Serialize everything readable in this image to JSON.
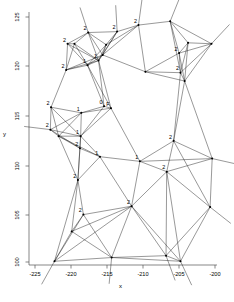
{
  "figure": {
    "background": "#ffffff",
    "line_color": "#000000",
    "text_color": "#000000",
    "width": 234,
    "height": 302
  },
  "axes": {
    "x_label": "x",
    "y_label": "y",
    "x_ticks": [
      "-225",
      "-220",
      "-215",
      "-210",
      "-205",
      "-200"
    ],
    "y_ticks": [
      "100",
      "105",
      "110",
      "115",
      "120",
      "125"
    ],
    "x_range": [
      -226.5,
      -199.2
    ],
    "y_range": [
      99.2,
      126.3
    ],
    "plot_left": 29,
    "plot_right": 217,
    "plot_top": 12,
    "plot_bottom": 265
  },
  "chart_data": {
    "type": "scatter",
    "title": "",
    "xlabel": "x",
    "ylabel": "y",
    "xlim": [
      -226.5,
      -199.2
    ],
    "ylim": [
      99.2,
      126.3
    ],
    "xticks": [
      -225,
      -220,
      -215,
      -210,
      -205,
      -200
    ],
    "yticks": [
      100,
      105,
      110,
      115,
      120,
      125
    ],
    "grid": false,
    "legend": "none",
    "nodes": [
      {
        "id": 0,
        "x": -220.9,
        "y": 122.9,
        "label": "2"
      },
      {
        "id": 1,
        "x": -219.9,
        "y": 122.9,
        "label": ""
      },
      {
        "id": 2,
        "x": -217.9,
        "y": 124.1,
        "label": "2"
      },
      {
        "id": 3,
        "x": -215.3,
        "y": 122.8,
        "label": ""
      },
      {
        "id": 4,
        "x": -213.7,
        "y": 124.2,
        "label": "2"
      },
      {
        "id": 5,
        "x": -210.6,
        "y": 124.9,
        "label": "2"
      },
      {
        "id": 6,
        "x": -206.0,
        "y": 125.3,
        "label": ""
      },
      {
        "id": 7,
        "x": -203.4,
        "y": 123.0,
        "label": ""
      },
      {
        "id": 8,
        "x": -221.1,
        "y": 120.1,
        "label": "2"
      },
      {
        "id": 9,
        "x": -218.0,
        "y": 120.6,
        "label": "1"
      },
      {
        "id": 10,
        "x": -216.4,
        "y": 121.1,
        "label": "1"
      },
      {
        "id": 11,
        "x": -215.8,
        "y": 121.7,
        "label": ""
      },
      {
        "id": 12,
        "x": -209.6,
        "y": 119.9,
        "label": ""
      },
      {
        "id": 13,
        "x": -204.7,
        "y": 121.9,
        "label": "2"
      },
      {
        "id": 14,
        "x": -204.5,
        "y": 119.8,
        "label": "2"
      },
      {
        "id": 15,
        "x": -203.9,
        "y": 118.9,
        "label": ""
      },
      {
        "id": 16,
        "x": -223.3,
        "y": 116.1,
        "label": "2"
      },
      {
        "id": 17,
        "x": -218.9,
        "y": 115.5,
        "label": "1"
      },
      {
        "id": 18,
        "x": -215.6,
        "y": 116.2,
        "label": "0"
      },
      {
        "id": 19,
        "x": -214.6,
        "y": 116.0,
        "label": "F"
      },
      {
        "id": 20,
        "x": -223.4,
        "y": 113.7,
        "label": "2"
      },
      {
        "id": 21,
        "x": -222.2,
        "y": 113.0,
        "label": ""
      },
      {
        "id": 22,
        "x": -219.0,
        "y": 113.0,
        "label": "1"
      },
      {
        "id": 23,
        "x": -219.1,
        "y": 111.7,
        "label": "2"
      },
      {
        "id": 24,
        "x": -216.2,
        "y": 110.8,
        "label": "1"
      },
      {
        "id": 25,
        "x": -210.4,
        "y": 110.3,
        "label": "1"
      },
      {
        "id": 26,
        "x": -205.5,
        "y": 112.5,
        "label": "2"
      },
      {
        "id": 27,
        "x": -206.5,
        "y": 109.2,
        "label": "2"
      },
      {
        "id": 28,
        "x": -219.4,
        "y": 108.3,
        "label": "2"
      },
      {
        "id": 29,
        "x": -211.6,
        "y": 105.5,
        "label": "2"
      },
      {
        "id": 30,
        "x": -218.6,
        "y": 104.6,
        "label": "2"
      },
      {
        "id": 31,
        "x": -220.3,
        "y": 102.8,
        "label": ""
      },
      {
        "id": 32,
        "x": -214.5,
        "y": 100.0,
        "label": ""
      },
      {
        "id": 33,
        "x": -206.6,
        "y": 100.2,
        "label": ""
      },
      {
        "id": 34,
        "x": -222.8,
        "y": 99.6,
        "label": ""
      },
      {
        "id": 35,
        "x": -204.5,
        "y": 99.6,
        "label": ""
      },
      {
        "id": 36,
        "x": -200.2,
        "y": 105.4,
        "label": ""
      },
      {
        "id": 37,
        "x": -199.9,
        "y": 110.6,
        "label": ""
      },
      {
        "id": 38,
        "x": -200.0,
        "y": 122.9,
        "label": ""
      }
    ],
    "node_labels": [
      "2",
      "2",
      "2",
      "2",
      "2",
      "2",
      "1",
      "1",
      "2",
      "2",
      "2",
      "2",
      "1",
      "0",
      "F",
      "2",
      "1",
      "2",
      "1",
      "1",
      "1",
      "2",
      "2",
      "2",
      "2",
      "2",
      "2"
    ],
    "label_values": {
      "0": 1,
      "1": 6,
      "2": 19,
      "F": 1
    }
  }
}
